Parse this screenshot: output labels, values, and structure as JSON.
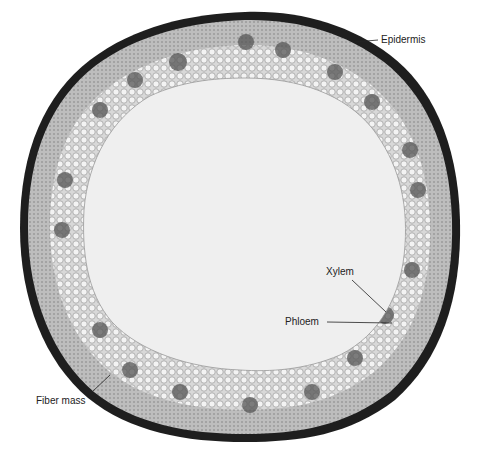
{
  "figure": {
    "labels": [
      {
        "text": "Epidermis",
        "x": 381,
        "y": 35
      },
      {
        "text": "Xylem",
        "x": 326,
        "y": 267
      },
      {
        "text": "Phloem",
        "x": 285,
        "y": 317
      },
      {
        "text": "Fiber mass",
        "x": 36,
        "y": 396
      }
    ]
  },
  "colors": {
    "background": "#ffffff",
    "pith": "#efefef",
    "ring": "#cfcfcf",
    "dark_band": "#1a1a1a",
    "label_text": "#222222"
  }
}
